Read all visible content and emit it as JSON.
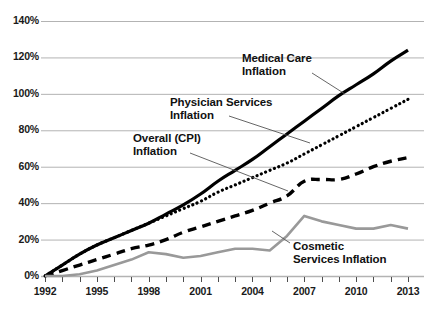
{
  "chart_data": {
    "type": "line",
    "title": "",
    "subtitle": "",
    "xlabel": "",
    "ylabel": "",
    "xlim": [
      1992,
      2013
    ],
    "ylim": [
      0,
      140
    ],
    "grid": true,
    "legend_position": "inline-annotations",
    "x_tick_labels": [
      "1992",
      "1995",
      "1998",
      "2001",
      "2004",
      "2007",
      "2010",
      "2013"
    ],
    "x_tick_values": [
      1992,
      1995,
      1998,
      2001,
      2004,
      2007,
      2010,
      2013
    ],
    "x_minor_ticks": [
      1993,
      1994,
      1996,
      1997,
      1999,
      2000,
      2002,
      2003,
      2005,
      2006,
      2008,
      2009,
      2011,
      2012
    ],
    "y_tick_labels": [
      "0%",
      "20%",
      "40%",
      "60%",
      "80%",
      "100%",
      "120%",
      "140%"
    ],
    "y_tick_values": [
      0,
      20,
      40,
      60,
      80,
      100,
      120,
      140
    ],
    "x": [
      1992,
      1993,
      1994,
      1995,
      1996,
      1997,
      1998,
      1999,
      2000,
      2001,
      2002,
      2003,
      2004,
      2005,
      2006,
      2007,
      2008,
      2009,
      2010,
      2011,
      2012,
      2013
    ],
    "series": [
      {
        "name": "Medical Care Inflation",
        "style": "solid",
        "color": "#000000",
        "width": 3.2,
        "values": [
          0,
          6,
          12,
          17,
          21,
          25,
          29,
          34,
          39,
          45,
          52,
          58,
          64,
          71,
          78,
          85,
          92,
          99,
          105,
          111,
          118,
          124
        ]
      },
      {
        "name": "Physician Services Inflation",
        "style": "dotted",
        "color": "#000000",
        "width": 3.2,
        "values": [
          0,
          6,
          12,
          17,
          21,
          25,
          29,
          33,
          37,
          41,
          46,
          50,
          54,
          58,
          62,
          67,
          72,
          77,
          82,
          87,
          92,
          97
        ]
      },
      {
        "name": "Overall (CPI) Inflation",
        "style": "dashed",
        "color": "#000000",
        "width": 3.4,
        "values": [
          0,
          3,
          6,
          9,
          12,
          15,
          17,
          20,
          24,
          27,
          30,
          33,
          36,
          40,
          44,
          52,
          53,
          53,
          56,
          60,
          63,
          65
        ]
      },
      {
        "name": "Cosmetic Services Inflation",
        "style": "solid",
        "color": "#999999",
        "width": 2.6,
        "values": [
          0,
          0,
          1,
          3,
          6,
          9,
          13,
          12,
          10,
          11,
          13,
          15,
          15,
          14,
          22,
          33,
          30,
          28,
          26,
          26,
          28,
          26
        ]
      }
    ],
    "annotations": [
      {
        "id": "medical-care",
        "lines": [
          "Medical Care",
          "Inflation"
        ],
        "text_x": 242,
        "text_y": 52,
        "leader": {
          "x1": 312,
          "y1": 73,
          "x2": 345,
          "y2": 94
        }
      },
      {
        "id": "physician-services",
        "lines": [
          "Physician Services",
          "Inflation"
        ],
        "text_x": 170,
        "text_y": 96,
        "leader": {
          "x1": 229,
          "y1": 116,
          "x2": 310,
          "y2": 143
        }
      },
      {
        "id": "overall-cpi",
        "lines": [
          "Overall (CPI)",
          "Inflation"
        ],
        "text_x": 133,
        "text_y": 132,
        "leader": {
          "x1": 190,
          "y1": 153,
          "x2": 288,
          "y2": 191
        }
      },
      {
        "id": "cosmetic-services",
        "lines": [
          "Cosmetic",
          "Services Inflation"
        ],
        "text_x": 293,
        "text_y": 240,
        "leader": {
          "x1": 290,
          "y1": 243,
          "x2": 272,
          "y2": 231
        }
      }
    ],
    "colors": {
      "background": "#ffffff",
      "gridline": "#b3b3b3",
      "axis": "#4d4d4d",
      "text": "#111111",
      "medical_care": "#000000",
      "physician_services": "#000000",
      "overall_cpi": "#000000",
      "cosmetic_services": "#999999"
    }
  }
}
